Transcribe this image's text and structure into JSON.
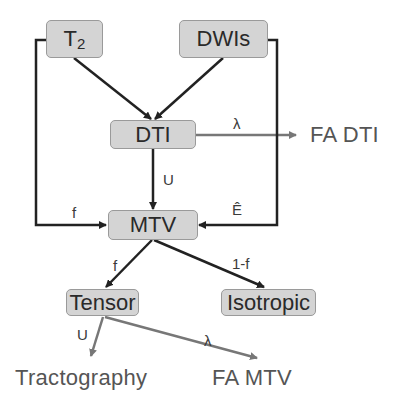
{
  "diagram": {
    "nodes": {
      "t2": {
        "label": "T",
        "subscript": "2"
      },
      "dwis": {
        "label": "DWIs"
      },
      "dti": {
        "label": "DTI"
      },
      "mtv": {
        "label": "MTV"
      },
      "tensor": {
        "label": "Tensor"
      },
      "isotropic": {
        "label": "Isotropic"
      }
    },
    "outputs": {
      "fa_dti": "FA DTI",
      "tractography": "Tractography",
      "fa_mtv": "FA MTV"
    },
    "edge_labels": {
      "dti_to_fa_dti": "λ",
      "dti_to_mtv": "U",
      "t2_to_mtv": "f",
      "dwis_to_mtv": "Ê",
      "mtv_to_tensor": "f",
      "mtv_to_isotropic": "1-f",
      "tensor_to_tractography": "U",
      "tensor_to_fa_mtv": "λ"
    },
    "colors": {
      "box_fill": "#d4d4d4",
      "box_border": "#9a9a9a",
      "dark_arrow": "#222222",
      "gray_arrow": "#777777"
    }
  }
}
